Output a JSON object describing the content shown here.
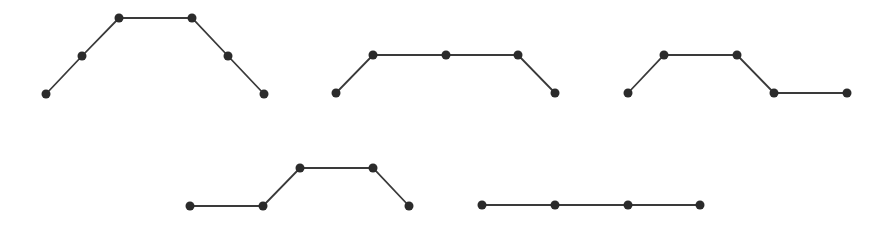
{
  "diagram": {
    "background": "#ffffff",
    "line_color": "#3a3a3a",
    "node_color": "#2b2b2b",
    "node_radius": 4.5,
    "shapes": [
      {
        "id": "polyline-1",
        "points": [
          [
            46,
            94
          ],
          [
            82,
            56
          ],
          [
            119,
            18
          ],
          [
            192,
            18
          ],
          [
            228,
            56
          ],
          [
            264,
            94
          ]
        ]
      },
      {
        "id": "polyline-2",
        "points": [
          [
            336,
            93
          ],
          [
            373,
            55
          ],
          [
            446,
            55
          ],
          [
            518,
            55
          ],
          [
            555,
            93
          ]
        ]
      },
      {
        "id": "polyline-3",
        "points": [
          [
            628,
            93
          ],
          [
            664,
            55
          ],
          [
            737,
            55
          ],
          [
            774,
            93
          ],
          [
            847,
            93
          ]
        ]
      },
      {
        "id": "polyline-4",
        "points": [
          [
            190,
            206
          ],
          [
            263,
            206
          ],
          [
            300,
            168
          ],
          [
            373,
            168
          ],
          [
            409,
            206
          ]
        ]
      },
      {
        "id": "polyline-5",
        "points": [
          [
            482,
            205
          ],
          [
            555,
            205
          ],
          [
            628,
            205
          ],
          [
            700,
            205
          ]
        ]
      }
    ]
  }
}
